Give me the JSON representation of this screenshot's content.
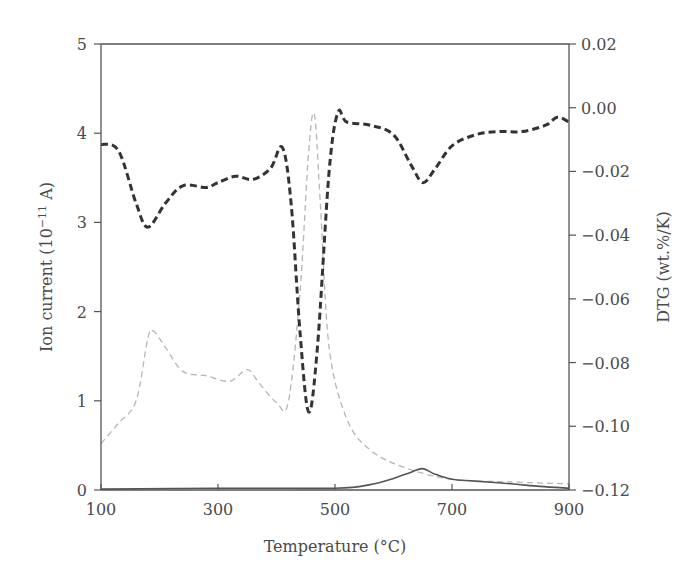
{
  "chart_data": {
    "type": "line",
    "title": "",
    "xlabel": "Temperature (°C)",
    "ylabel": "Ion current (10−11 A)",
    "ylabel_base": "Ion current (10",
    "ylabel_exp": "−11",
    "ylabel_tail": " A)",
    "y2label": "DTG (wt.%/K)",
    "xlim": [
      100,
      900
    ],
    "ylim": [
      0,
      5
    ],
    "y2lim": [
      -0.12,
      0.02
    ],
    "grid": false,
    "legend": "none",
    "xticks": [
      "100",
      "300",
      "500",
      "700",
      "900"
    ],
    "yticks": [
      "0",
      "1",
      "2",
      "3",
      "4",
      "5"
    ],
    "y2ticks": [
      "0.02",
      "0.00",
      "−0.02",
      "−0.04",
      "−0.06",
      "−0.08",
      "−0.10",
      "−0.12"
    ],
    "series": [
      {
        "name": "DTG",
        "axis": "right",
        "style": "thick-dashed",
        "color": "#333333",
        "x": [
          100,
          130,
          160,
          180,
          210,
          240,
          280,
          300,
          330,
          360,
          390,
          410,
          425,
          440,
          455,
          470,
          490,
          505,
          520,
          560,
          600,
          630,
          650,
          670,
          700,
          740,
          780,
          820,
          860,
          880,
          900
        ],
        "y": [
          -0.0115,
          -0.0135,
          -0.03,
          -0.0375,
          -0.03,
          -0.0245,
          -0.025,
          -0.0235,
          -0.0215,
          -0.0225,
          -0.019,
          -0.0125,
          -0.03,
          -0.07,
          -0.0955,
          -0.075,
          -0.02,
          -0.0015,
          -0.0045,
          -0.0055,
          -0.0085,
          -0.018,
          -0.0235,
          -0.0195,
          -0.012,
          -0.0085,
          -0.0075,
          -0.0075,
          -0.0055,
          -0.003,
          -0.0045
        ]
      },
      {
        "name": "Ion current (m/z A)",
        "axis": "left",
        "style": "thin-light-dashed",
        "color": "#b5b5b5",
        "x": [
          100,
          130,
          160,
          180,
          190,
          210,
          240,
          280,
          320,
          350,
          370,
          400,
          420,
          440,
          455,
          465,
          475,
          490,
          520,
          560,
          620,
          700,
          800,
          900
        ],
        "y": [
          0.52,
          0.75,
          1.0,
          1.7,
          1.78,
          1.6,
          1.33,
          1.28,
          1.22,
          1.35,
          1.2,
          0.98,
          0.98,
          2.2,
          3.8,
          4.2,
          3.2,
          1.6,
          0.8,
          0.45,
          0.25,
          0.12,
          0.09,
          0.07
        ]
      },
      {
        "name": "Ion current (m/z B)",
        "axis": "left",
        "style": "solid",
        "color": "#555555",
        "x": [
          100,
          300,
          500,
          560,
          600,
          630,
          650,
          670,
          700,
          740,
          800,
          850,
          900
        ],
        "y": [
          0.01,
          0.02,
          0.02,
          0.06,
          0.13,
          0.2,
          0.24,
          0.18,
          0.12,
          0.1,
          0.07,
          0.04,
          0.02
        ]
      }
    ]
  },
  "colors": {
    "axis": "#555555",
    "dtg": "#333333",
    "ion_a": "#b5b5b5",
    "ion_b": "#555555"
  }
}
